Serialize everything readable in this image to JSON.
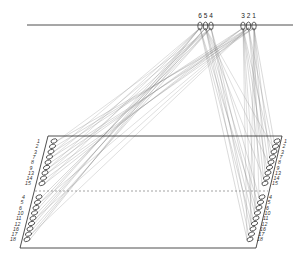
{
  "diagram": {
    "type": "thread-connection-diagram",
    "top_loops": {
      "left_group": [
        "6",
        "5",
        "4"
      ],
      "right_group": [
        "3",
        "2",
        "1"
      ]
    },
    "frame": {
      "left_column": {
        "upper_labels": [
          "1",
          "2",
          "3",
          "7",
          "8",
          "9",
          "13",
          "14",
          "15"
        ],
        "lower_labels": [
          "4",
          "5",
          "6",
          "10",
          "11",
          "12",
          "16",
          "17",
          "18"
        ]
      },
      "right_column": {
        "upper_labels": [
          "1",
          "2",
          "3",
          "7",
          "8",
          "9",
          "13",
          "14",
          "15"
        ],
        "lower_labels": [
          "4",
          "5",
          "6",
          "10",
          "11",
          "12",
          "16",
          "17",
          "18"
        ]
      }
    },
    "colors": {
      "line": "#222222",
      "thread": "#777777",
      "background": "#ffffff"
    }
  }
}
